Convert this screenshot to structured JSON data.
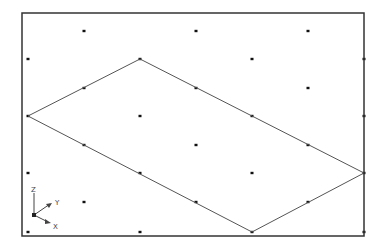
{
  "viewport": {
    "name": "isometric-drawing-viewport",
    "background": "#ffffff",
    "frame": {
      "x1": 22,
      "y1": 13,
      "x2": 364,
      "y2": 236,
      "color": "#333333"
    },
    "grid": {
      "type": "isometric-dot-grid",
      "dot_color": "#111111",
      "rows": [
        {
          "y": 31,
          "xs": [
            84,
            196,
            308
          ]
        },
        {
          "y": 59,
          "xs": [
            28,
            140,
            252,
            364
          ]
        },
        {
          "y": 88,
          "xs": [
            84,
            196,
            308
          ]
        },
        {
          "y": 116,
          "xs": [
            28,
            140,
            252,
            364
          ]
        },
        {
          "y": 145,
          "xs": [
            84,
            196,
            308
          ]
        },
        {
          "y": 173,
          "xs": [
            28,
            140,
            252,
            364
          ]
        },
        {
          "y": 202,
          "xs": [
            84,
            196,
            308
          ]
        },
        {
          "y": 232,
          "xs": [
            28,
            140,
            252,
            364
          ]
        }
      ]
    },
    "shape": {
      "type": "parallelogram",
      "stroke": "#555555",
      "vertices": [
        [
          28,
          116
        ],
        [
          140,
          59
        ],
        [
          364,
          173
        ],
        [
          252,
          232
        ]
      ]
    },
    "ucs_icon": {
      "origin": [
        34,
        215
      ],
      "labels": {
        "z": "Z",
        "y": "Y",
        "x": "X"
      }
    }
  }
}
